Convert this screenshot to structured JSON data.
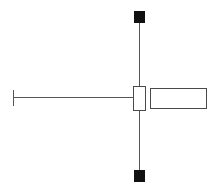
{
  "canvas": {
    "width": 213,
    "height": 196,
    "background_color": "#ffffff",
    "title": "Technical Line Diagram"
  },
  "style": {
    "stroke_color": "#555555",
    "stroke_color_dark": "#4a4a4a",
    "marker_fill_color": "#111111",
    "box_fill_color": "#ffffff",
    "line_width": 1.6,
    "box_stroke_width": 1.4
  },
  "diagram": {
    "type": "schematic-line-drawing",
    "shapes": [
      {
        "name": "vertical-beam",
        "kind": "line",
        "x1": 139.5,
        "y1": 20,
        "x2": 139.5,
        "y2": 172
      },
      {
        "name": "horizontal-beam",
        "kind": "line",
        "x1": 13,
        "y1": 97.5,
        "x2": 139.5,
        "y2": 97.5
      },
      {
        "name": "left-endcap-tick",
        "kind": "line",
        "x1": 13.5,
        "y1": 90,
        "x2": 13.5,
        "y2": 106
      },
      {
        "name": "top-square-marker",
        "kind": "rect-filled",
        "x": 134.5,
        "y": 11.5,
        "width": 10,
        "height": 11
      },
      {
        "name": "bottom-square-marker",
        "kind": "rect-filled",
        "x": 134.5,
        "y": 170,
        "width": 10,
        "height": 11
      },
      {
        "name": "junction-box",
        "kind": "rect-outline",
        "x": 133.5,
        "y": 86.5,
        "width": 12,
        "height": 24
      },
      {
        "name": "right-rectangle",
        "kind": "rect-outline",
        "x": 150.5,
        "y": 88.5,
        "width": 56,
        "height": 20
      }
    ]
  },
  "labels": {
    "visible_text": []
  }
}
